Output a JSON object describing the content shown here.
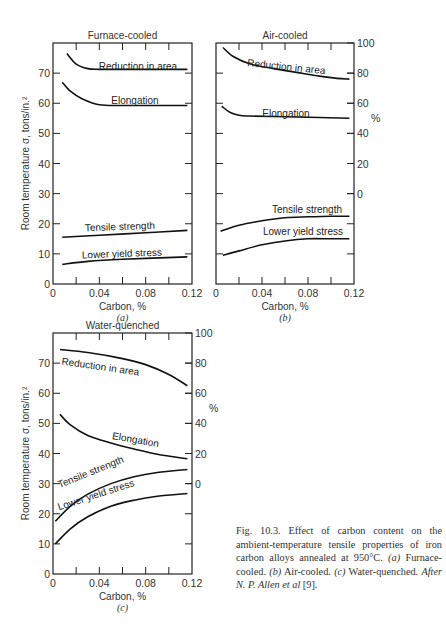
{
  "chart_data": [
    {
      "id": "a",
      "type": "line",
      "title": "Furnace-cooled",
      "sublabel": "(a)",
      "xlabel": "Carbon, %",
      "ylabel": "Room temperature σ, tons/in.²",
      "y2label": "%",
      "xlim": [
        0,
        0.12
      ],
      "ylim": [
        0,
        80
      ],
      "y2lim": [
        0,
        100
      ],
      "x_ticks": [
        "0",
        "0.04",
        "0.08",
        "0.12"
      ],
      "y_ticks": [
        "0",
        "10",
        "20",
        "30",
        "40",
        "50",
        "60",
        "70"
      ],
      "y2_ticks": [],
      "series": [
        {
          "name": "Reduction in area",
          "axis": "y2",
          "x": [
            0.012,
            0.02,
            0.03,
            0.04,
            0.06,
            0.08,
            0.1,
            0.116
          ],
          "values": [
            93,
            86,
            83,
            82.5,
            82.5,
            82.5,
            82.5,
            82.5
          ]
        },
        {
          "name": "Elongation",
          "axis": "y2",
          "x": [
            0.008,
            0.015,
            0.025,
            0.04,
            0.06,
            0.08,
            0.1,
            0.116
          ],
          "values": [
            74,
            68,
            63,
            59,
            58.5,
            58.5,
            58.5,
            58.5
          ]
        },
        {
          "name": "Tensile strength",
          "axis": "y",
          "x": [
            0.008,
            0.04,
            0.08,
            0.116
          ],
          "values": [
            15.5,
            16.2,
            17,
            17.8
          ]
        },
        {
          "name": "Lower yield stress",
          "axis": "y",
          "x": [
            0.008,
            0.03,
            0.06,
            0.116
          ],
          "values": [
            6.5,
            7.5,
            8.2,
            9
          ]
        }
      ]
    },
    {
      "id": "b",
      "type": "line",
      "title": "Air-cooled",
      "sublabel": "(b)",
      "xlabel": "Carbon, %",
      "y2label": "%",
      "xlim": [
        0,
        0.12
      ],
      "ylim": [
        0,
        80
      ],
      "y2lim": [
        0,
        100
      ],
      "x_ticks": [
        "0",
        "0.04",
        "0.08",
        "0.12"
      ],
      "y2_ticks": [
        "0",
        "20",
        "40",
        "60",
        "80",
        "100"
      ],
      "series": [
        {
          "name": "Reduction in area",
          "axis": "y2",
          "x": [
            0.006,
            0.015,
            0.03,
            0.05,
            0.07,
            0.09,
            0.105,
            0.116
          ],
          "values": [
            97,
            91,
            86,
            83,
            80.5,
            78,
            76.5,
            76
          ]
        },
        {
          "name": "Elongation",
          "axis": "y2",
          "x": [
            0.005,
            0.012,
            0.02,
            0.03,
            0.06,
            0.09,
            0.116
          ],
          "values": [
            58,
            54,
            52,
            51.5,
            51,
            50.5,
            50
          ]
        },
        {
          "name": "Tensile strength",
          "axis": "y",
          "x": [
            0.004,
            0.02,
            0.04,
            0.06,
            0.08,
            0.1,
            0.116
          ],
          "values": [
            17.5,
            19.5,
            21,
            22,
            22.3,
            22.5,
            22.5
          ]
        },
        {
          "name": "Lower yield stress",
          "axis": "y",
          "x": [
            0.006,
            0.02,
            0.04,
            0.06,
            0.08,
            0.1,
            0.116
          ],
          "values": [
            9.5,
            11,
            13,
            14.3,
            15,
            15,
            15
          ]
        }
      ]
    },
    {
      "id": "c",
      "type": "line",
      "title": "Water-quenched",
      "sublabel": "(c)",
      "xlabel": "Carbon, %",
      "ylabel": "Room temperature σ, tons/in.²",
      "y2label": "%",
      "xlim": [
        0,
        0.12
      ],
      "ylim": [
        0,
        80
      ],
      "y2lim": [
        0,
        100
      ],
      "x_ticks": [
        "0",
        "0.04",
        "0.08",
        "0.12"
      ],
      "y_ticks": [
        "0",
        "10",
        "20",
        "30",
        "40",
        "50",
        "60",
        "70"
      ],
      "y2_ticks": [
        "0",
        "20",
        "40",
        "60",
        "80",
        "100"
      ],
      "series": [
        {
          "name": "Reduction in area",
          "axis": "y2",
          "x": [
            0.006,
            0.03,
            0.06,
            0.08,
            0.1,
            0.116
          ],
          "values": [
            89,
            87,
            83,
            79,
            72.5,
            65
          ]
        },
        {
          "name": "Elongation",
          "axis": "y2",
          "x": [
            0.006,
            0.015,
            0.03,
            0.05,
            0.07,
            0.09,
            0.116
          ],
          "values": [
            46,
            39,
            32,
            27,
            23,
            19.5,
            16.5
          ]
        },
        {
          "name": "Tensile strength",
          "axis": "y",
          "x": [
            0.002,
            0.015,
            0.03,
            0.05,
            0.07,
            0.09,
            0.116
          ],
          "values": [
            17.5,
            22.5,
            26.5,
            30,
            32.3,
            33.7,
            34.7
          ]
        },
        {
          "name": "Lower yield stress",
          "axis": "y",
          "x": [
            0.002,
            0.015,
            0.03,
            0.05,
            0.07,
            0.09,
            0.116
          ],
          "values": [
            10,
            15,
            19,
            22.5,
            24.5,
            25.8,
            26.7
          ]
        }
      ]
    }
  ],
  "labels": {
    "ylabel": "Room temperature σ, tons/in.²",
    "xlabel": "Carbon, %",
    "y2label": "%"
  },
  "caption": {
    "lead": "Fig. 10.3. Effect of carbon content on the ambient-temperature tensile properties of iron carbon alloys annealed at 950°C.",
    "a_tag": "(a)",
    "a_text": "Furnace-cooled.",
    "b_tag": "(b)",
    "b_text": "Air-cooled.",
    "c_tag": "(c)",
    "c_text": "Water-quenched.",
    "credit": "After N. P. Allen et al",
    "ref": "[9]."
  }
}
